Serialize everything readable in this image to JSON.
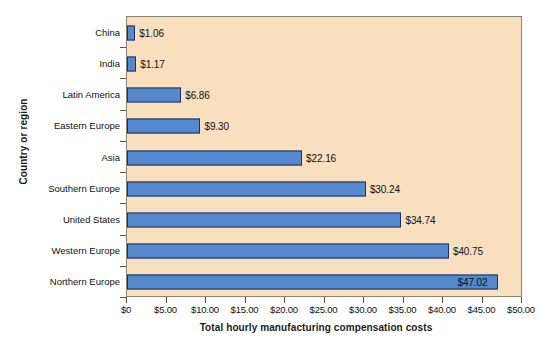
{
  "chart_data": {
    "type": "bar",
    "orientation": "horizontal",
    "title": "",
    "xlabel": "Total hourly manufacturing compensation costs",
    "ylabel": "Country or region",
    "categories": [
      "China",
      "India",
      "Latin America",
      "Eastern Europe",
      "Asia",
      "Southern Europe",
      "United States",
      "Western Europe",
      "Northern Europe"
    ],
    "values": [
      1.06,
      1.17,
      6.86,
      9.3,
      22.16,
      30.24,
      34.74,
      40.75,
      47.02
    ],
    "value_labels": [
      "$1.06",
      "$1.17",
      "$6.86",
      "$9.30",
      "$22.16",
      "$30.24",
      "$34.74",
      "$40.75",
      "$47.02"
    ],
    "xlim": [
      0,
      50
    ],
    "xticks": [
      0,
      5,
      10,
      15,
      20,
      25,
      30,
      35,
      40,
      45,
      50
    ],
    "xtick_labels": [
      "$0",
      "$5.00",
      "$10.00",
      "$15.00",
      "$20.00",
      "$25.00",
      "$30.00",
      "$35.00",
      "$40.00",
      "$45.00",
      "$50.00"
    ],
    "grid": false,
    "legend": false,
    "colors": {
      "bar_fill": "#5588cc",
      "bar_border": "#20305e",
      "plot_background": "#f8dfbe",
      "plot_border": "#8c8470",
      "text": "#111111",
      "page_background": "#ffffff"
    }
  }
}
